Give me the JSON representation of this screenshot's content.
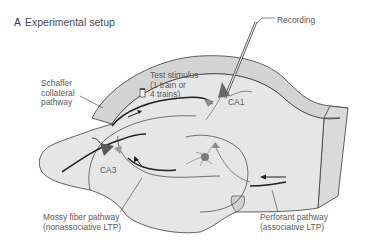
{
  "panel": {
    "letter": "A",
    "title": "Experimental setup"
  },
  "labels": {
    "recording": "Recording",
    "test_stimulus": [
      "Test stimulus",
      "(1 train or",
      "4 trains)"
    ],
    "schaffer": [
      "Schaffer",
      "collateral",
      "pathway"
    ],
    "ca1": "CA1",
    "ca3": "CA3",
    "mossy": [
      "Mossy fiber pathway",
      "(nonassociative LTP)"
    ],
    "perforant": [
      "Perforant pathway",
      "(associative LTP)"
    ]
  },
  "colors": {
    "tissue_fill": "#e6e6e6",
    "tissue_band": "#d4d4d4",
    "outline": "#3a3a3a",
    "pathway": "#1e1e1e",
    "neuron": "#6a6a6a",
    "neuron_light": "#9a9a9a",
    "text": "#5a5a5a"
  }
}
